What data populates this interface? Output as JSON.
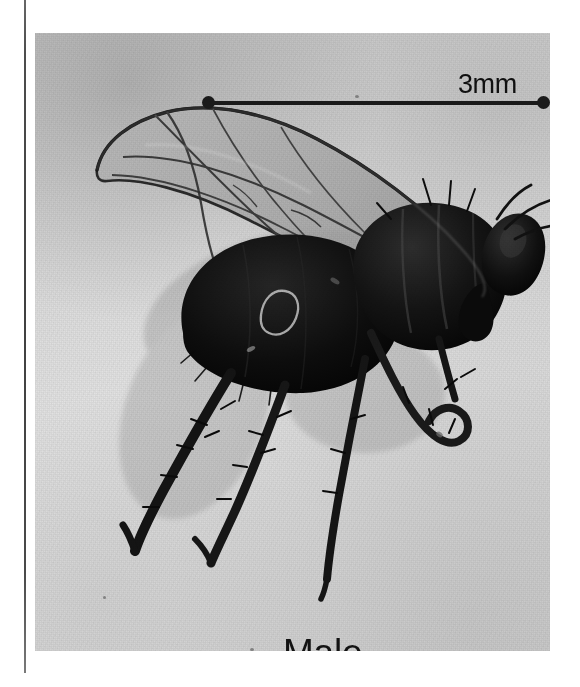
{
  "figure": {
    "type": "specimen-photograph",
    "view": "lateral",
    "background_color": "#d8d8d8",
    "ink_color": "#1a1a1a",
    "page_rule_color": "#333333"
  },
  "scale_bar": {
    "label": "3mm",
    "value": 3,
    "unit": "mm",
    "endpoint_style": "round-dot",
    "x_start_px": 170,
    "x_end_px": 512,
    "y_px": 69,
    "length_px": 342
  },
  "caption": {
    "sex_label": "Male"
  },
  "photo_bounds": {
    "left": 35,
    "top": 33,
    "width": 515,
    "height": 618
  },
  "specks": [
    {
      "x": 436,
      "y": 432,
      "r": 3.2
    },
    {
      "x": 355,
      "y": 95,
      "r": 1.8
    },
    {
      "x": 103,
      "y": 596,
      "r": 1.6
    },
    {
      "x": 250,
      "y": 648,
      "r": 1.7
    }
  ]
}
